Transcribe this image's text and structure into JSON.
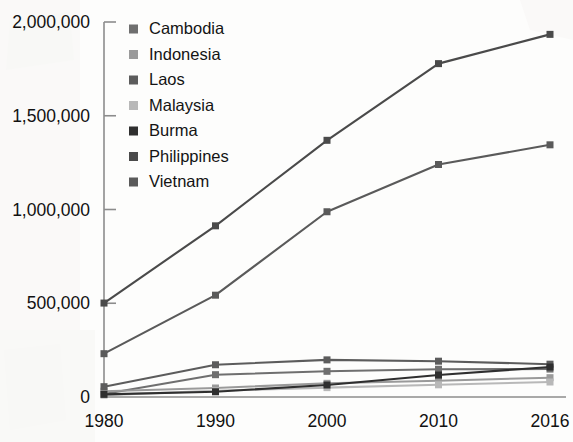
{
  "chart_data": {
    "type": "line",
    "title": "",
    "subtitle": "",
    "xlabel": "",
    "ylabel": "",
    "x": [
      "1980",
      "1990",
      "2000",
      "2010",
      "2016"
    ],
    "categories": [
      "1980",
      "1990",
      "2000",
      "2010",
      "2016"
    ],
    "xlim": [
      0,
      4
    ],
    "ylim": [
      0,
      2000000
    ],
    "y_ticks": [
      0,
      500000,
      1000000,
      1500000,
      2000000
    ],
    "y_tick_labels": [
      "0",
      "500,000",
      "1,000,000",
      "1,500,000",
      "2,000,000"
    ],
    "x_tick_labels": [
      "1980",
      "1990",
      "2000",
      "2010",
      "2016"
    ],
    "grid": false,
    "legend_position": "top-left-inside",
    "markers": "square",
    "series": [
      {
        "name": "Cambodia",
        "color": "#6f6f6f",
        "values": [
          16000,
          119000,
          137000,
          148000,
          149000
        ]
      },
      {
        "name": "Indonesia",
        "color": "#9a9a9a",
        "values": [
          31000,
          48000,
          73000,
          87000,
          103000
        ]
      },
      {
        "name": "Laos",
        "color": "#5c5c5c",
        "values": [
          55000,
          172000,
          198000,
          191000,
          175000
        ]
      },
      {
        "name": "Malaysia",
        "color": "#b8b8b8",
        "values": [
          10000,
          33000,
          50000,
          65000,
          80000
        ]
      },
      {
        "name": "Burma",
        "color": "#2f2f2f",
        "values": [
          14000,
          28000,
          64000,
          117000,
          160000
        ]
      },
      {
        "name": "Philippines",
        "color": "#4a4a4a",
        "values": [
          501000,
          913000,
          1369000,
          1778000,
          1934000
        ]
      },
      {
        "name": "Vietnam",
        "color": "#5a5a5a",
        "values": [
          231000,
          543000,
          988000,
          1240000,
          1345000
        ]
      }
    ]
  },
  "legend": {
    "items": [
      {
        "label": "Cambodia"
      },
      {
        "label": "Indonesia"
      },
      {
        "label": "Laos"
      },
      {
        "label": "Malaysia"
      },
      {
        "label": "Burma"
      },
      {
        "label": "Philippines"
      },
      {
        "label": "Vietnam"
      }
    ]
  },
  "axes": {
    "y_labels": [
      "2,000,000",
      "1,500,000",
      "1,000,000",
      "500,000",
      "0"
    ],
    "x_labels": [
      "1980",
      "1990",
      "2000",
      "2010",
      "2016"
    ]
  },
  "colors": {
    "axis": "#8c8c8c",
    "text": "#111111",
    "background": "#fdfdfc"
  }
}
